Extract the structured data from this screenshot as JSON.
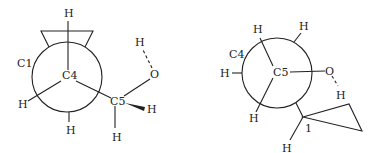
{
  "diagram": {
    "type": "newman-projections",
    "left_projection": {
      "front_atom": "C4",
      "rear_label": "C1",
      "front_substituents": [
        "H",
        "H",
        "C5"
      ],
      "rear_substituents": [
        "H",
        "cyclopropyl"
      ],
      "c5_substituents": {
        "hydroxyl": {
          "o_label": "O",
          "h_label": "H"
        },
        "wedge_h": "H",
        "down_h": "H"
      },
      "labels": {
        "top_h": "H",
        "left_h": "H",
        "bottom_h": "H",
        "c1": "C1",
        "c4": "C4",
        "c5": "C5",
        "oh_h": "H",
        "o": "O",
        "wedge_h": "H",
        "c5_down_h": "H"
      }
    },
    "right_projection": {
      "front_atom": "C5",
      "rear_label": "C4",
      "labels": {
        "c4": "C4",
        "c5": "C5",
        "top_left_h": "H",
        "top_right_h": "H",
        "left_h": "H",
        "bottom_left_h": "H",
        "o": "O",
        "oh_h": "H",
        "cyclopropyl_position": "1",
        "cyclopropyl_h": "H"
      }
    }
  }
}
